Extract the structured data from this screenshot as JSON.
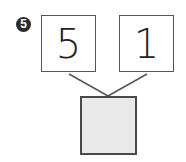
{
  "problem": {
    "number": "5",
    "number_glyph": "❺",
    "parts": [
      {
        "label": "5"
      },
      {
        "label": "1"
      }
    ],
    "answer": {
      "value": "",
      "state": "blank"
    }
  },
  "colors": {
    "border": "#555555",
    "answer_fill": "#e9e9e9",
    "badge": "#2b2b2b"
  }
}
